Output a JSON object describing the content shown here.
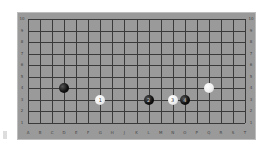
{
  "board": {
    "columns": [
      "A",
      "B",
      "C",
      "D",
      "E",
      "F",
      "G",
      "H",
      "J",
      "K",
      "L",
      "M",
      "N",
      "O",
      "P",
      "Q",
      "R",
      "S",
      "T"
    ],
    "rows": [
      "10",
      "9",
      "8",
      "7",
      "6",
      "5",
      "4",
      "3",
      "2",
      "1"
    ],
    "background_color": "#9a9a9a",
    "line_color": "#3a3a3a"
  },
  "stones": [
    {
      "color": "black",
      "col": "D",
      "row": "4",
      "label": ""
    },
    {
      "color": "white",
      "col": "G",
      "row": "3",
      "label": "1"
    },
    {
      "color": "black",
      "col": "L",
      "row": "3",
      "label": "2"
    },
    {
      "color": "white",
      "col": "N",
      "row": "3",
      "label": "3"
    },
    {
      "color": "black",
      "col": "O",
      "row": "3",
      "label": "4"
    },
    {
      "color": "white",
      "col": "Q",
      "row": "4",
      "label": ""
    }
  ]
}
